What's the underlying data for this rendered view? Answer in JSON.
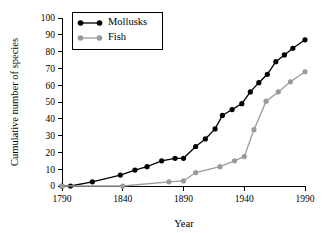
{
  "chart_data": {
    "type": "line",
    "title": "",
    "xlabel": "Year",
    "ylabel": "Cumulative number of species",
    "xlim": [
      1790,
      1990
    ],
    "ylim": [
      0,
      100
    ],
    "grid": false,
    "legend_position": "top-left",
    "x_ticks": [
      "1790",
      "1840",
      "1890",
      "1940",
      "1990"
    ],
    "x_tick_values": [
      1790,
      1840,
      1890,
      1940,
      1990
    ],
    "y_ticks": [
      "0",
      "10",
      "20",
      "30",
      "40",
      "50",
      "60",
      "70",
      "80",
      "90",
      "100"
    ],
    "y_tick_values": [
      0,
      10,
      20,
      30,
      40,
      50,
      60,
      70,
      80,
      90,
      100
    ],
    "series": [
      {
        "name": "Mollusks",
        "color": "#000000",
        "marker": "circle",
        "x": [
          1790,
          1797,
          1815,
          1838,
          1850,
          1860,
          1872,
          1883,
          1890,
          1900,
          1908,
          1916,
          1922,
          1930,
          1938,
          1945,
          1952,
          1959,
          1966,
          1973,
          1980,
          1990
        ],
        "y": [
          0,
          0,
          2.5,
          6.5,
          9.5,
          11.5,
          15,
          16.5,
          16.5,
          23.5,
          28,
          34,
          42,
          45.5,
          49,
          56,
          61.5,
          66.5,
          74,
          78,
          82,
          87
        ]
      },
      {
        "name": "Fish",
        "color": "#9a9a9a",
        "marker": "circle",
        "x": [
          1790,
          1840,
          1878,
          1890,
          1900,
          1920,
          1932,
          1940,
          1948,
          1958,
          1968,
          1978,
          1990
        ],
        "y": [
          0,
          0,
          2.5,
          3,
          8,
          11.5,
          15,
          17.5,
          33.5,
          50.5,
          56,
          62,
          68
        ]
      }
    ]
  },
  "legend": {
    "items": [
      {
        "label": "Mollusks",
        "color": "#000000"
      },
      {
        "label": "Fish",
        "color": "#9a9a9a"
      }
    ]
  }
}
